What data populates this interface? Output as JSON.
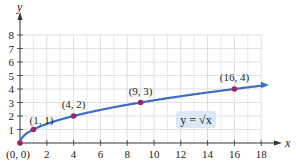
{
  "chart_data": {
    "type": "line",
    "title": "",
    "xlabel": "x",
    "ylabel": "y",
    "xlim": [
      0,
      18
    ],
    "ylim": [
      0,
      8
    ],
    "grid": true,
    "x_ticks": [
      2,
      4,
      6,
      8,
      10,
      12,
      14,
      16,
      18
    ],
    "y_ticks": [
      1,
      2,
      3,
      4,
      5,
      6,
      7,
      8
    ],
    "series": [
      {
        "name": "y = √x",
        "function": "sqrt(x)",
        "color": "#3b6fc6",
        "x_range": [
          0,
          18.2
        ]
      }
    ],
    "points": [
      {
        "x": 0,
        "y": 0,
        "label": "(0, 0)"
      },
      {
        "x": 1,
        "y": 1,
        "label": "(1, 1)"
      },
      {
        "x": 4,
        "y": 2,
        "label": "(4, 2)"
      },
      {
        "x": 9,
        "y": 3,
        "label": "(9, 3)"
      },
      {
        "x": 16,
        "y": 4,
        "label": "(16, 4)"
      }
    ],
    "annotations": [
      {
        "text": "y = √x",
        "x": 14.5,
        "y": 1.7,
        "boxed": true,
        "box_color": "#dbe8f6"
      }
    ],
    "colors": {
      "curve": "#3b6fc6",
      "points": "#a3245c",
      "grid": "#d9d9d9",
      "axis": "#333333",
      "label_box": "#dbe8f6"
    }
  }
}
